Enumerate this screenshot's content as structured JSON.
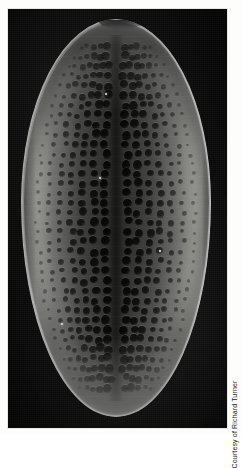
{
  "figure": {
    "name": "diatom-sem-micrograph",
    "photo_credit": "Courtesy of Richard Turner",
    "background_color": "#fdfdfc",
    "plate_color": "#0a0a0a"
  },
  "specimen": {
    "kind": "diatom-valve",
    "outline": "elliptical-ovate",
    "imaging": "scanning-electron-micrograph",
    "features": {
      "limb": "bright-silica-rim",
      "sternum": "central-axial-band",
      "areolae": "rows-of-pores",
      "apex_notch": "rim-break-at-top-apex"
    },
    "colors": {
      "limb_highlight": "#d9d9d3",
      "valve_mid": "#8f8f8c",
      "valve_center": "#353534",
      "areola": "#000000"
    }
  },
  "areolae_grid": {
    "rows": 36,
    "row_spacing_pct": 2.45,
    "first_row_top_pct": 7.0,
    "max_per_row": 15,
    "diameter_px": [
      3,
      9
    ]
  },
  "specks": [
    {
      "left_pct": 44.0,
      "top_pct": 18.5,
      "size_px": 2
    },
    {
      "left_pct": 41.0,
      "top_pct": 39.8,
      "size_px": 2
    },
    {
      "left_pct": 72.5,
      "top_pct": 58.0,
      "size_px": 2
    },
    {
      "left_pct": 21.0,
      "top_pct": 76.5,
      "size_px": 2
    }
  ]
}
